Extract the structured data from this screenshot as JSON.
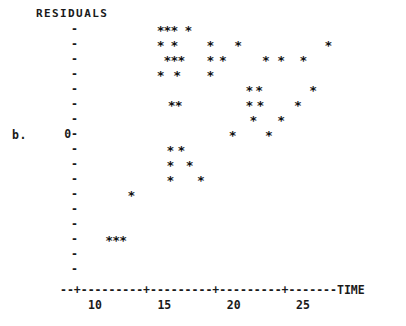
{
  "plot": {
    "panel_label": "b.",
    "y_axis_title": "RESIDUALS",
    "x_axis_title": "TIME",
    "zero_label": "0",
    "tick_glyph": "-",
    "point_glyph": "*",
    "x_axis_line": "--+---------+---------+---------+-------",
    "x_tick_labels": [
      "10",
      "15",
      "20",
      "25"
    ],
    "x_tick_values": [
      10,
      15,
      20,
      25
    ],
    "y_rows": [
      {
        "label": "",
        "tick": "-"
      },
      {
        "label": "",
        "tick": "-"
      },
      {
        "label": "",
        "tick": "-"
      },
      {
        "label": "",
        "tick": "-"
      },
      {
        "label": "",
        "tick": "-"
      },
      {
        "label": "",
        "tick": "-"
      },
      {
        "label": "",
        "tick": "-"
      },
      {
        "label": "0",
        "tick": "-"
      },
      {
        "label": "",
        "tick": "-"
      },
      {
        "label": "",
        "tick": "-"
      },
      {
        "label": "",
        "tick": "-"
      },
      {
        "label": "",
        "tick": "-"
      },
      {
        "label": "",
        "tick": "-"
      },
      {
        "label": "",
        "tick": "-"
      },
      {
        "label": "",
        "tick": "-"
      },
      {
        "label": "",
        "tick": "-"
      },
      {
        "label": "",
        "tick": "-"
      }
    ]
  },
  "chart_data": {
    "type": "scatter",
    "title": "",
    "xlabel": "TIME",
    "ylabel": "RESIDUALS",
    "xlim": [
      8.5,
      28.5
    ],
    "ylim": [
      -9,
      7
    ],
    "grid": false,
    "legend": null,
    "marker": "*",
    "x_axis_tick_values": [
      10,
      15,
      20,
      25
    ],
    "y_axis_zero_row_index": 7,
    "y_rows_above_zero": 7,
    "y_rows_below_zero": 9,
    "points": [
      {
        "x": 14.7,
        "y": 7
      },
      {
        "x": 15.2,
        "y": 7
      },
      {
        "x": 15.7,
        "y": 7
      },
      {
        "x": 16.7,
        "y": 7
      },
      {
        "x": 14.7,
        "y": 6
      },
      {
        "x": 15.7,
        "y": 6
      },
      {
        "x": 18.3,
        "y": 6
      },
      {
        "x": 20.3,
        "y": 6
      },
      {
        "x": 26.8,
        "y": 6
      },
      {
        "x": 15.2,
        "y": 5
      },
      {
        "x": 15.7,
        "y": 5
      },
      {
        "x": 16.2,
        "y": 5
      },
      {
        "x": 18.3,
        "y": 5
      },
      {
        "x": 19.2,
        "y": 5
      },
      {
        "x": 22.3,
        "y": 5
      },
      {
        "x": 23.4,
        "y": 5
      },
      {
        "x": 25.0,
        "y": 5
      },
      {
        "x": 14.7,
        "y": 4
      },
      {
        "x": 15.9,
        "y": 4
      },
      {
        "x": 18.3,
        "y": 4
      },
      {
        "x": 21.1,
        "y": 3
      },
      {
        "x": 21.8,
        "y": 3
      },
      {
        "x": 25.7,
        "y": 3
      },
      {
        "x": 15.5,
        "y": 2
      },
      {
        "x": 16.0,
        "y": 2
      },
      {
        "x": 21.1,
        "y": 2
      },
      {
        "x": 21.9,
        "y": 2
      },
      {
        "x": 24.6,
        "y": 2
      },
      {
        "x": 21.4,
        "y": 1
      },
      {
        "x": 23.4,
        "y": 1
      },
      {
        "x": 19.9,
        "y": 0
      },
      {
        "x": 22.5,
        "y": 0
      },
      {
        "x": 15.4,
        "y": -1
      },
      {
        "x": 16.2,
        "y": -1
      },
      {
        "x": 15.4,
        "y": -2
      },
      {
        "x": 16.8,
        "y": -2
      },
      {
        "x": 15.4,
        "y": -3
      },
      {
        "x": 17.6,
        "y": -3
      },
      {
        "x": 12.6,
        "y": -4
      },
      {
        "x": 11.0,
        "y": -7
      },
      {
        "x": 11.5,
        "y": -7
      },
      {
        "x": 12.0,
        "y": -7
      }
    ]
  }
}
